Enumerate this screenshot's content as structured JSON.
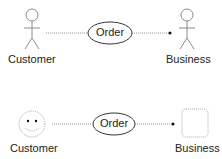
{
  "diagram": {
    "row1": {
      "actor_left_label": "Customer",
      "actor_right_label": "Business",
      "use_case_label": "Order",
      "actor_style": "stick-figure"
    },
    "row2": {
      "actor_left_label": "Customer",
      "actor_right_label": "Business",
      "use_case_label": "Order",
      "actor_style": "dotted-face-and-box"
    },
    "colors": {
      "stroke": "#888888",
      "text": "#222222",
      "oval_stroke": "#222222",
      "dotted_line": "#999999"
    }
  }
}
